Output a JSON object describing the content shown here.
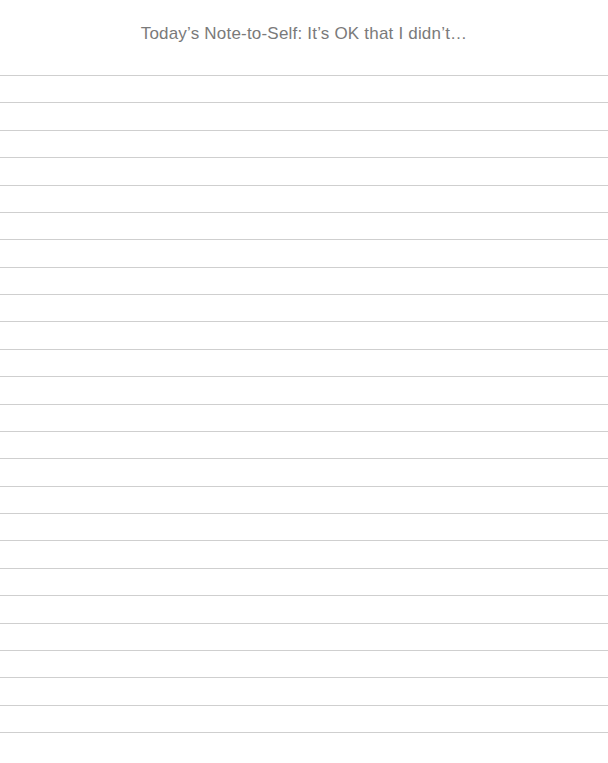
{
  "page": {
    "title": "Today’s Note-to-Self: It’s OK that I didn’t…",
    "ruled_lines": {
      "count": 25,
      "first_y": 75,
      "spacing": 27.375,
      "color": "#cfcfcf"
    }
  }
}
